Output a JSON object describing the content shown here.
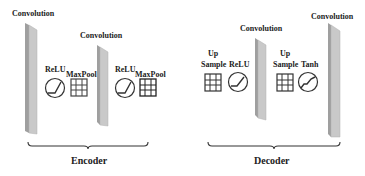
{
  "diagram": {
    "encoder": {
      "label": "Encoder",
      "conv1_label": "Convolution",
      "conv2_label": "Convolution",
      "relu1_label": "ReLU",
      "maxpool1_label": "MaxPool",
      "relu2_label": "ReLU",
      "maxpool2_label": "MaxPool"
    },
    "decoder": {
      "label": "Decoder",
      "upsample1_label_line1": "Up",
      "upsample1_label_line2": "Sample",
      "relu_label": "ReLU",
      "conv3_label": "Convolution",
      "upsample2_label_line1": "Up",
      "upsample2_label_line2": "Sample",
      "tanh_label": "Tanh",
      "conv4_label": "Convolution"
    },
    "icons": {
      "convolution": "slab-icon",
      "relu": "relu-curve-icon",
      "tanh": "tanh-curve-icon",
      "pool": "grid-icon",
      "upsample": "grid-icon"
    },
    "colors": {
      "slab_face": "#c8c8c8",
      "slab_edge": "#a9a9a9",
      "stroke": "#333333",
      "grid": "#444444"
    }
  }
}
